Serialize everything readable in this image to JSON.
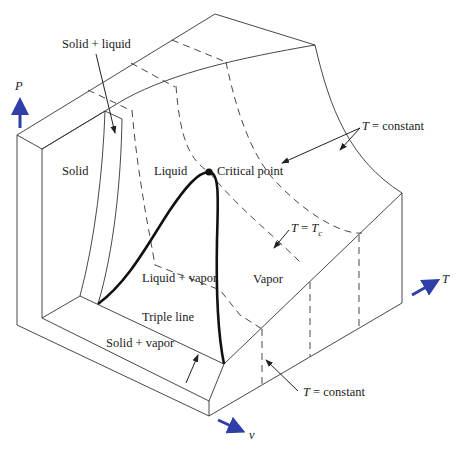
{
  "diagram": {
    "type": "P-v-T surface",
    "axes": {
      "p": {
        "label": "P",
        "color": "#2f3fa8"
      },
      "t": {
        "label": "T",
        "color": "#2f3fa8"
      },
      "v": {
        "label": "v",
        "color": "#2f3fa8"
      }
    },
    "regions": {
      "solid": "Solid",
      "liquid": "Liquid",
      "vapor": "Vapor",
      "liquid_vapor": "Liquid + vapor",
      "solid_liquid": "Solid + liquid",
      "solid_vapor": "Solid + vapor"
    },
    "annotations": {
      "critical_point": "Critical point",
      "triple_line": "Triple line",
      "t_constant_top": "T = constant",
      "t_constant_bottom": "T = constant",
      "t_critical": {
        "lhs": "T",
        "eq": " = ",
        "rhs": "T",
        "sub": "c"
      }
    }
  }
}
